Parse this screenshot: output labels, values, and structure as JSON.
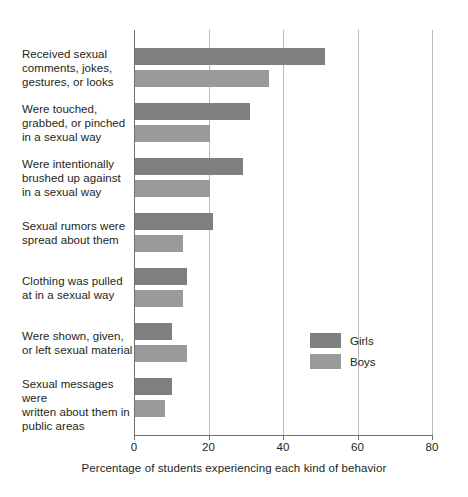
{
  "chart_data": {
    "type": "bar",
    "orientation": "horizontal",
    "title": "",
    "xlabel": "Percentage of students experiencing each kind of behavior",
    "ylabel": "",
    "xlim": [
      0,
      80
    ],
    "xticks": [
      0,
      20,
      40,
      60,
      80
    ],
    "xtick_labels": [
      "0",
      "20",
      "40",
      "60",
      "80"
    ],
    "grid": "vertical gridlines at 20, 40, 60, 80",
    "legend_position": "inside plot area, middle-right",
    "categories": [
      "Received sexual comments, jokes, gestures, or looks",
      "Were touched, grabbed, or pinched in a sexual way",
      "Were intentionally brushed up against in a sexual way",
      "Sexual rumors were spread about them",
      "Clothing was pulled at in a sexual way",
      "Were shown, given, or left sexual material",
      "Sexual messages were written about them in public areas"
    ],
    "category_label_lines": [
      [
        "Received sexual",
        "comments, jokes,",
        "gestures, or looks"
      ],
      [
        "Were touched,",
        "grabbed, or pinched",
        "in a sexual way"
      ],
      [
        "Were intentionally",
        "brushed up against",
        "in a sexual way"
      ],
      [
        "Sexual rumors were",
        "spread about them"
      ],
      [
        "Clothing was pulled",
        "at in a sexual way"
      ],
      [
        "Were shown, given,",
        "or left sexual material"
      ],
      [
        "Sexual messages were",
        "written about them in",
        "public areas"
      ]
    ],
    "series": [
      {
        "name": "Girls",
        "color": "#7f7f7f",
        "values": [
          51,
          31,
          29,
          21,
          14,
          10,
          10
        ]
      },
      {
        "name": "Boys",
        "color": "#9a9a9a",
        "values": [
          36,
          20,
          20,
          13,
          13,
          14,
          8
        ]
      }
    ]
  },
  "legend": {
    "items": [
      {
        "label": "Girls",
        "color": "#7f7f7f"
      },
      {
        "label": "Boys",
        "color": "#9a9a9a"
      }
    ]
  },
  "axis": {
    "tick_labels": [
      "0",
      "20",
      "40",
      "60",
      "80"
    ],
    "x_title": "Percentage of students experiencing each kind of behavior"
  },
  "colors": {
    "girls": "#7f7f7f",
    "boys": "#9a9a9a",
    "gridline": "#b9b9b9",
    "axis": "#6f6f6f",
    "text": "#231f20",
    "background": "#ffffff"
  }
}
